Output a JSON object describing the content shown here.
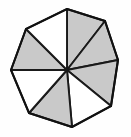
{
  "figure": {
    "shape_name": "octagon",
    "sector_count": 8,
    "shaded_count": 4,
    "unshaded_count": 4,
    "background_color": "#fefefe",
    "shaded_fill_color": "#c9c9c9",
    "unshaded_fill_color": "#ffffff",
    "stroke_color": "#1a1a1a",
    "center": {
      "x": 67,
      "y": 70
    },
    "vertices": [
      {
        "name": "top",
        "x": 67,
        "y": 9
      },
      {
        "name": "upper-right",
        "x": 105,
        "y": 21
      },
      {
        "name": "right",
        "x": 118,
        "y": 60
      },
      {
        "name": "lower-right",
        "x": 111,
        "y": 106
      },
      {
        "name": "bottom",
        "x": 72,
        "y": 127
      },
      {
        "name": "lower-left",
        "x": 29,
        "y": 113
      },
      {
        "name": "left",
        "x": 11,
        "y": 70
      },
      {
        "name": "upper-left",
        "x": 26,
        "y": 29
      }
    ],
    "sectors": [
      {
        "id": "sector-1",
        "from": "top",
        "to": "upper-right",
        "shaded": true,
        "points": "67,70 67,9 105,21"
      },
      {
        "id": "sector-2",
        "from": "upper-right",
        "to": "right",
        "shaded": true,
        "points": "67,70 105,21 118,60"
      },
      {
        "id": "sector-3",
        "from": "right",
        "to": "lower-right",
        "shaded": true,
        "points": "67,70 118,60 111,106"
      },
      {
        "id": "sector-4",
        "from": "lower-right",
        "to": "bottom",
        "shaded": false,
        "points": "67,70 111,106 72,127"
      },
      {
        "id": "sector-5",
        "from": "bottom",
        "to": "lower-left",
        "shaded": true,
        "points": "67,70 72,127 29,113"
      },
      {
        "id": "sector-6",
        "from": "lower-left",
        "to": "left",
        "shaded": false,
        "points": "67,70 29,113 11,70"
      },
      {
        "id": "sector-7",
        "from": "left",
        "to": "upper-left",
        "shaded": true,
        "points": "67,70 11,70 26,29"
      },
      {
        "id": "sector-8",
        "from": "upper-left",
        "to": "top",
        "shaded": false,
        "points": "67,70 26,29 67,9"
      }
    ],
    "outline_points": "67,9 105,21 118,60 111,106 72,127 29,113 11,70 26,29"
  }
}
